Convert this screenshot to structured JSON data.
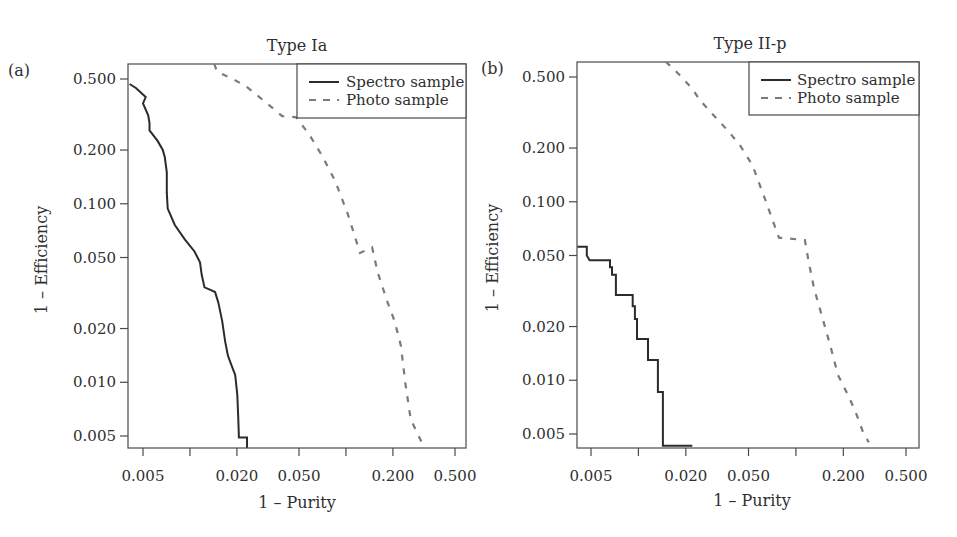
{
  "figure": {
    "panels": [
      {
        "letter": "(a)",
        "title": "Type Ia",
        "xlabel": "1 – Purity",
        "ylabel": "1 – Efficiency",
        "legend": {
          "spectro": "Spectro sample",
          "photo": "Photo sample"
        }
      },
      {
        "letter": "(b)",
        "title": "Type II-p",
        "xlabel": "1 – Purity",
        "ylabel": "1 – Efficiency",
        "legend": {
          "spectro": "Spectro sample",
          "photo": "Photo sample"
        }
      }
    ]
  },
  "colors": {
    "axis": "#4a4a4a",
    "spectro": "#2b2b2b",
    "photo": "#7a7a7a",
    "text": "#2f2f2f"
  },
  "chart_data": [
    {
      "type": "line",
      "panel": "(a)",
      "title": "Type Ia",
      "xlabel": "1 – Purity",
      "ylabel": "1 – Efficiency",
      "xscale": "log",
      "yscale": "log",
      "xlim": [
        0.0041,
        0.62
      ],
      "ylim": [
        0.0043,
        0.61
      ],
      "xticks": [
        0.005,
        0.01,
        0.02,
        0.05,
        0.1,
        0.2,
        0.5
      ],
      "xtick_labels": [
        "0.005",
        "",
        "0.020",
        "0.050",
        "",
        "0.200",
        "0.500"
      ],
      "yticks": [
        0.5,
        0.2,
        0.1,
        0.05,
        0.02,
        0.01,
        0.005
      ],
      "ytick_labels": [
        "0.500",
        "0.200",
        "0.100",
        "0.050",
        "0.020",
        "0.010",
        "0.005"
      ],
      "grid": false,
      "legend_position": "upper right",
      "series": [
        {
          "name": "Spectro sample",
          "style": "solid",
          "x": [
            0.0041,
            0.0045,
            0.0052,
            0.005,
            0.0054,
            0.0055,
            0.0055,
            0.0062,
            0.0067,
            0.0069,
            0.0071,
            0.0071,
            0.0072,
            0.008,
            0.0093,
            0.0107,
            0.0116,
            0.0119,
            0.0124,
            0.0134,
            0.0145,
            0.0152,
            0.0161,
            0.0168,
            0.0175,
            0.0185,
            0.0195,
            0.0201,
            0.0204,
            0.0206,
            0.0232,
            0.0232
          ],
          "y": [
            0.469,
            0.445,
            0.396,
            0.365,
            0.313,
            0.283,
            0.258,
            0.225,
            0.2,
            0.182,
            0.15,
            0.115,
            0.094,
            0.076,
            0.063,
            0.054,
            0.047,
            0.04,
            0.034,
            0.033,
            0.032,
            0.028,
            0.022,
            0.017,
            0.0141,
            0.0124,
            0.011,
            0.0085,
            0.0062,
            0.0049,
            0.0049,
            0.0043
          ]
        },
        {
          "name": "Photo sample",
          "style": "dashed",
          "x": [
            0.0143,
            0.0149,
            0.018,
            0.0225,
            0.028,
            0.039,
            0.048,
            0.058,
            0.07,
            0.085,
            0.103,
            0.123,
            0.147,
            0.16,
            0.185,
            0.205,
            0.225,
            0.24,
            0.26,
            0.31
          ],
          "y": [
            0.61,
            0.55,
            0.51,
            0.46,
            0.395,
            0.31,
            0.305,
            0.245,
            0.187,
            0.135,
            0.087,
            0.053,
            0.057,
            0.041,
            0.028,
            0.022,
            0.016,
            0.0099,
            0.0062,
            0.0045
          ]
        }
      ]
    },
    {
      "type": "line",
      "panel": "(b)",
      "title": "Type II-p",
      "xlabel": "1 – Purity",
      "ylabel": "1 – Efficiency",
      "xscale": "log",
      "yscale": "log",
      "xlim": [
        0.0041,
        0.59
      ],
      "ylim": [
        0.0043,
        0.61
      ],
      "xticks": [
        0.005,
        0.01,
        0.02,
        0.05,
        0.1,
        0.2,
        0.5
      ],
      "xtick_labels": [
        "0.005",
        "",
        "0.020",
        "0.050",
        "",
        "0.200",
        "0.500"
      ],
      "yticks": [
        0.5,
        0.2,
        0.1,
        0.05,
        0.02,
        0.01,
        0.005
      ],
      "ytick_labels": [
        "0.500",
        "0.200",
        "0.100",
        "0.050",
        "0.020",
        "0.010",
        "0.005"
      ],
      "grid": false,
      "legend_position": "upper right",
      "series": [
        {
          "name": "Spectro sample",
          "style": "solid-step",
          "x": [
            0.0041,
            0.0047,
            0.0047,
            0.0049,
            0.0066,
            0.0066,
            0.0068,
            0.0068,
            0.0072,
            0.0072,
            0.0092,
            0.0092,
            0.0095,
            0.0095,
            0.0098,
            0.0098,
            0.0115,
            0.0115,
            0.0133,
            0.0133,
            0.0143,
            0.0143,
            0.022
          ],
          "y": [
            0.056,
            0.056,
            0.05,
            0.047,
            0.047,
            0.043,
            0.043,
            0.039,
            0.039,
            0.03,
            0.03,
            0.026,
            0.026,
            0.022,
            0.022,
            0.017,
            0.017,
            0.013,
            0.013,
            0.0086,
            0.0086,
            0.0043,
            0.0043
          ]
        },
        {
          "name": "Photo sample",
          "style": "dashed",
          "x": [
            0.0149,
            0.018,
            0.022,
            0.0246,
            0.03,
            0.037,
            0.044,
            0.053,
            0.064,
            0.078,
            0.114,
            0.12,
            0.13,
            0.146,
            0.165,
            0.185,
            0.215,
            0.24,
            0.265,
            0.29
          ],
          "y": [
            0.61,
            0.52,
            0.43,
            0.37,
            0.305,
            0.25,
            0.208,
            0.16,
            0.102,
            0.063,
            0.061,
            0.047,
            0.033,
            0.023,
            0.0157,
            0.0107,
            0.0082,
            0.0066,
            0.0052,
            0.0045
          ]
        }
      ]
    }
  ]
}
